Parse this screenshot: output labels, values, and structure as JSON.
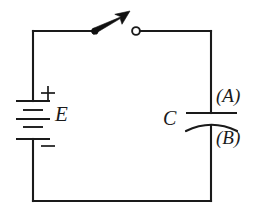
{
  "figure": {
    "type": "electrical-circuit-schematic",
    "background_color": "#ffffff",
    "line_color": "#1a1a1a",
    "width": 262,
    "height": 219
  },
  "labels": {
    "emf": "E",
    "capacitor": "C",
    "plate_top": "(A)",
    "plate_bottom": "(B)",
    "battery_positive": "+",
    "battery_negative": "−"
  },
  "components": [
    {
      "id": "battery",
      "name": "battery-symbol",
      "label": "E",
      "terminals": {
        "positive": "+",
        "negative": "−"
      },
      "position": "left-branch",
      "plate_count": 4
    },
    {
      "id": "switch",
      "name": "switch-symbol",
      "state": "open",
      "position": "top-branch",
      "pivot_side": "left",
      "terminal_side": "right"
    },
    {
      "id": "capacitor",
      "name": "capacitor-symbol",
      "label": "C",
      "position": "right-branch",
      "top_plate_label": "(A)",
      "bottom_plate_label": "(B)",
      "style": "polarized-curved-plate"
    }
  ],
  "geometry": {
    "loop": {
      "left_x": 33,
      "right_x": 211,
      "top_y": 31,
      "bottom_y": 201
    },
    "switch": {
      "pivot_x": 95,
      "pivot_y": 31,
      "tip_x": 128,
      "tip_y": 12,
      "terminal_x": 135,
      "terminal_y": 31
    },
    "battery": {
      "center_x": 33,
      "center_y": 120
    },
    "capacitor": {
      "center_x": 211,
      "top_plate_y": 113,
      "bottom_plate_y": 126
    }
  }
}
